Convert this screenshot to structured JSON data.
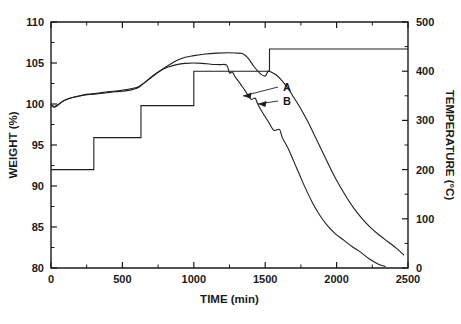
{
  "chart_data": {
    "type": "line",
    "title": "",
    "xlabel": "TIME (min)",
    "ylabel": "WEIGHT (%)",
    "y2label": "TEMPERATURE (°C)",
    "xlim": [
      0,
      2500
    ],
    "ylim": [
      80,
      110
    ],
    "y2lim": [
      0,
      500
    ],
    "grid": false,
    "legend_position": "inline-annotation",
    "x_ticks": [
      0,
      500,
      1000,
      1500,
      2000,
      2500
    ],
    "x_tick_labels": [
      "0",
      "500",
      "1000",
      "1500",
      "2000",
      "2500"
    ],
    "x_minor_ticks": [
      250,
      750,
      1250,
      1750,
      2250
    ],
    "y_ticks": [
      80,
      85,
      90,
      95,
      100,
      105,
      110
    ],
    "y_tick_labels": [
      "80",
      "85",
      "90",
      "95",
      "100",
      "105",
      "110"
    ],
    "y_minor_ticks": [
      82.5,
      87.5,
      92.5,
      97.5,
      102.5,
      107.5
    ],
    "y2_ticks": [
      0,
      100,
      200,
      300,
      400,
      500
    ],
    "y2_tick_labels": [
      "0",
      "100",
      "200",
      "300",
      "400",
      "500"
    ],
    "y2_minor_ticks": [
      50,
      150,
      250,
      350,
      450
    ],
    "annotations": [
      {
        "text": "A",
        "points_to_series": "A",
        "x": 1390,
        "y": 101.1
      },
      {
        "text": "B",
        "points_to_series": "B",
        "x": 1330,
        "y": 98.6
      }
    ],
    "series": [
      {
        "name": "A",
        "axis": "left",
        "units": "%",
        "points": [
          [
            0,
            99.9
          ],
          [
            20,
            99.6
          ],
          [
            45,
            99.8
          ],
          [
            70,
            100.2
          ],
          [
            100,
            100.5
          ],
          [
            150,
            100.8
          ],
          [
            200,
            101.0
          ],
          [
            260,
            101.2
          ],
          [
            320,
            101.3
          ],
          [
            400,
            101.5
          ],
          [
            470,
            101.6
          ],
          [
            540,
            101.8
          ],
          [
            600,
            102.0
          ],
          [
            640,
            102.4
          ],
          [
            700,
            103.2
          ],
          [
            760,
            104.0
          ],
          [
            820,
            104.7
          ],
          [
            880,
            105.3
          ],
          [
            940,
            105.7
          ],
          [
            1000,
            105.9
          ],
          [
            1080,
            106.1
          ],
          [
            1160,
            106.2
          ],
          [
            1240,
            106.25
          ],
          [
            1300,
            106.2
          ],
          [
            1340,
            106.15
          ],
          [
            1380,
            105.6
          ],
          [
            1420,
            104.6
          ],
          [
            1460,
            103.8
          ],
          [
            1500,
            103.4
          ],
          [
            1520,
            104.0
          ],
          [
            1540,
            103.9
          ],
          [
            1580,
            103.5
          ],
          [
            1620,
            102.8
          ],
          [
            1660,
            101.9
          ],
          [
            1700,
            100.8
          ],
          [
            1750,
            99.4
          ],
          [
            1800,
            97.8
          ],
          [
            1850,
            96.0
          ],
          [
            1900,
            94.2
          ],
          [
            1950,
            92.4
          ],
          [
            2000,
            90.7
          ],
          [
            2060,
            88.9
          ],
          [
            2120,
            87.3
          ],
          [
            2180,
            86.0
          ],
          [
            2240,
            84.9
          ],
          [
            2300,
            84.0
          ],
          [
            2360,
            83.2
          ],
          [
            2420,
            82.4
          ],
          [
            2470,
            81.6
          ]
        ]
      },
      {
        "name": "B",
        "axis": "left",
        "units": "%",
        "points": [
          [
            0,
            99.9
          ],
          [
            25,
            99.7
          ],
          [
            55,
            100.0
          ],
          [
            90,
            100.4
          ],
          [
            130,
            100.7
          ],
          [
            180,
            100.9
          ],
          [
            240,
            101.1
          ],
          [
            300,
            101.2
          ],
          [
            380,
            101.35
          ],
          [
            450,
            101.5
          ],
          [
            520,
            101.6
          ],
          [
            580,
            101.8
          ],
          [
            620,
            102.1
          ],
          [
            660,
            102.7
          ],
          [
            710,
            103.4
          ],
          [
            760,
            104.0
          ],
          [
            820,
            104.5
          ],
          [
            880,
            104.8
          ],
          [
            940,
            104.95
          ],
          [
            1000,
            105.0
          ],
          [
            1060,
            104.95
          ],
          [
            1120,
            104.85
          ],
          [
            1180,
            104.8
          ],
          [
            1230,
            104.75
          ],
          [
            1250,
            103.8
          ],
          [
            1270,
            103.9
          ],
          [
            1290,
            103.3
          ],
          [
            1320,
            102.6
          ],
          [
            1360,
            101.6
          ],
          [
            1400,
            100.6
          ],
          [
            1430,
            100.7
          ],
          [
            1450,
            99.9
          ],
          [
            1480,
            99.0
          ],
          [
            1520,
            97.9
          ],
          [
            1560,
            96.8
          ],
          [
            1600,
            96.9
          ],
          [
            1620,
            95.9
          ],
          [
            1660,
            94.6
          ],
          [
            1700,
            93.0
          ],
          [
            1740,
            91.4
          ],
          [
            1780,
            89.8
          ],
          [
            1830,
            88.0
          ],
          [
            1880,
            86.5
          ],
          [
            1930,
            85.3
          ],
          [
            1990,
            84.2
          ],
          [
            2050,
            83.4
          ],
          [
            2110,
            82.6
          ],
          [
            2170,
            81.9
          ],
          [
            2230,
            81.1
          ],
          [
            2290,
            80.5
          ],
          [
            2340,
            80.2
          ]
        ]
      },
      {
        "name": "temperature-program",
        "axis": "right",
        "units": "°C",
        "style": "step",
        "points": [
          [
            0,
            200
          ],
          [
            300,
            200
          ],
          [
            300,
            265
          ],
          [
            630,
            265
          ],
          [
            630,
            330
          ],
          [
            1000,
            330
          ],
          [
            1000,
            400
          ],
          [
            1530,
            400
          ],
          [
            1530,
            445
          ],
          [
            2500,
            445
          ]
        ]
      }
    ]
  },
  "axes": {
    "x_title": "TIME (min)",
    "y_title": "WEIGHT (%)",
    "y2_title": "TEMPERATURE (°C)"
  },
  "labels": {
    "series_a": "A",
    "series_b": "B"
  },
  "colors": {
    "ink": "#1f1f1f",
    "background": "#ffffff"
  }
}
